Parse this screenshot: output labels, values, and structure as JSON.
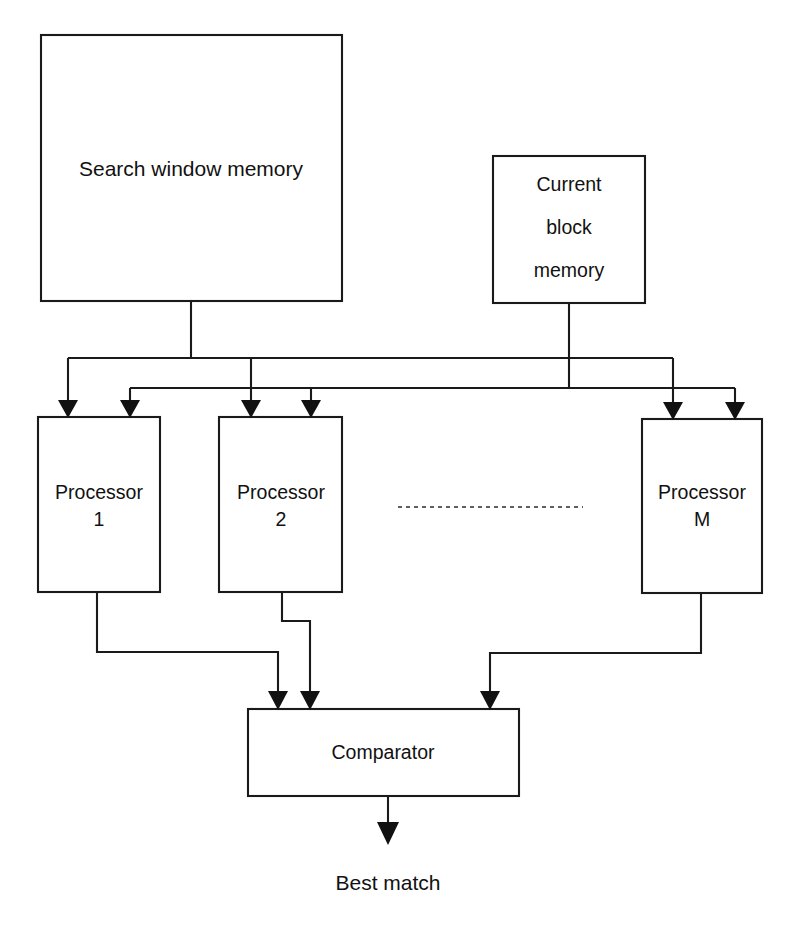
{
  "diagram": {
    "background_color": "#ffffff",
    "line_color": "#1a1a1a",
    "blocks": {
      "search_window_memory": {
        "label": "Search window memory"
      },
      "current_block_memory": {
        "line1": "Current",
        "line2": "block",
        "line3": "memory"
      },
      "processor_1": {
        "line1": "Processor",
        "line2": "1"
      },
      "processor_2": {
        "line1": "Processor",
        "line2": "2"
      },
      "processor_m": {
        "line1": "Processor",
        "line2": "M"
      },
      "comparator": {
        "label": "Comparator"
      }
    },
    "output": {
      "label": "Best match"
    },
    "ellipsis": {
      "label": ""
    }
  }
}
